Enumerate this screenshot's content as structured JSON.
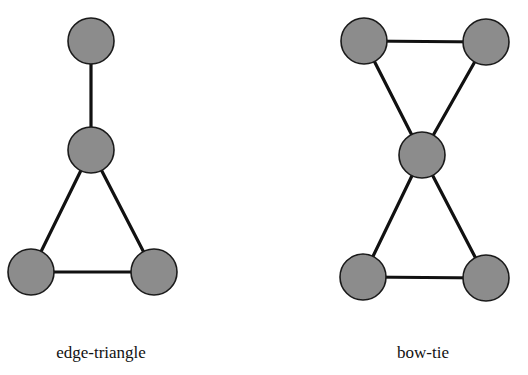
{
  "figure": {
    "node_fill": "#8c8c8c",
    "edge_color": "#111111",
    "graphs": [
      {
        "id": "edge-triangle",
        "label": "edge-triangle",
        "nodes": [
          "top",
          "middle",
          "bottom-left",
          "bottom-right"
        ],
        "edges": [
          [
            "top",
            "middle"
          ],
          [
            "middle",
            "bottom-left"
          ],
          [
            "middle",
            "bottom-right"
          ],
          [
            "bottom-left",
            "bottom-right"
          ]
        ]
      },
      {
        "id": "bow-tie",
        "label": "bow-tie",
        "nodes": [
          "top-left",
          "top-right",
          "center",
          "bottom-left",
          "bottom-right"
        ],
        "edges": [
          [
            "top-left",
            "top-right"
          ],
          [
            "top-left",
            "center"
          ],
          [
            "top-right",
            "center"
          ],
          [
            "center",
            "bottom-left"
          ],
          [
            "center",
            "bottom-right"
          ],
          [
            "bottom-left",
            "bottom-right"
          ]
        ]
      }
    ]
  }
}
